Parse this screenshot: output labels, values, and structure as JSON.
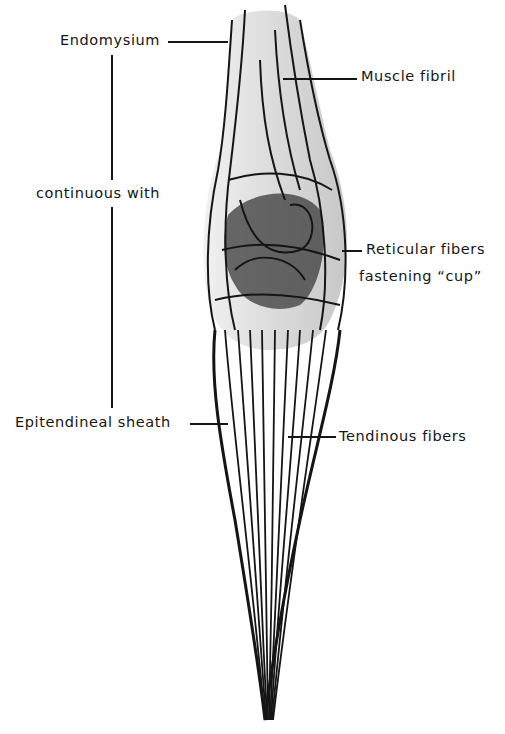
{
  "diagram": {
    "labels": {
      "endomysium": "Endomysium",
      "continuous_with": "continuous with",
      "epitendineal_sheath": "Epitendineal sheath",
      "muscle_fibril": "Muscle fibril",
      "reticular_fibers": "Reticular fibers",
      "fastening_cup": "fastening “cup”",
      "tendinous_fibers": "Tendinous fibers"
    },
    "colors": {
      "ink": "#151515",
      "shade": "#b5b5b5",
      "background": "#ffffff"
    }
  }
}
